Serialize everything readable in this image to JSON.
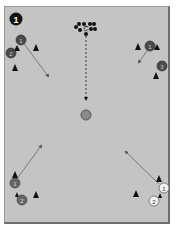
{
  "diagram": {
    "step_number": "1",
    "field_color": "#c4c4c4",
    "coach_label": "C",
    "players_dark": [
      {
        "label": "1",
        "x": 21,
        "y": 40
      },
      {
        "label": "2",
        "x": 11,
        "y": 53
      },
      {
        "label": "1",
        "x": 150,
        "y": 46
      },
      {
        "label": "3",
        "x": 162,
        "y": 66
      },
      {
        "label": "1",
        "x": 15,
        "y": 183
      },
      {
        "label": "2",
        "x": 22,
        "y": 200
      }
    ],
    "players_light": [
      {
        "label": "1",
        "x": 164,
        "y": 188
      },
      {
        "label": "2",
        "x": 154,
        "y": 201
      }
    ]
  }
}
